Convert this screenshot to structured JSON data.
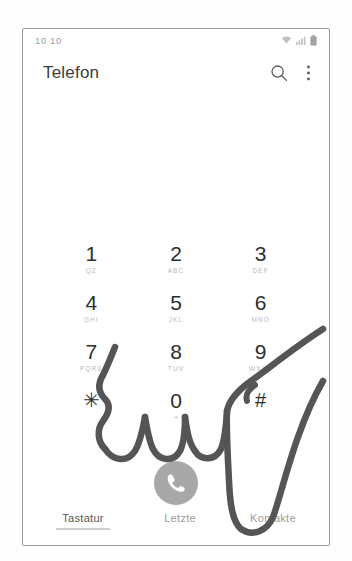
{
  "status_bar": {
    "clock": "10 10",
    "icons": [
      "wifi-icon",
      "signal-icon",
      "battery-icon"
    ]
  },
  "app_bar": {
    "title": "Telefon",
    "actions": [
      {
        "name": "search-icon",
        "label": "Suche"
      },
      {
        "name": "overflow-menu-icon",
        "label": "Mehr"
      }
    ]
  },
  "number_display": {
    "entered_number": ""
  },
  "keypad": {
    "keys": [
      {
        "digit": "1",
        "sub": "QZ"
      },
      {
        "digit": "2",
        "sub": "ABC"
      },
      {
        "digit": "3",
        "sub": "DEF"
      },
      {
        "digit": "4",
        "sub": "GHI"
      },
      {
        "digit": "5",
        "sub": "JKL"
      },
      {
        "digit": "6",
        "sub": "MNO"
      },
      {
        "digit": "7",
        "sub": "PQRS"
      },
      {
        "digit": "8",
        "sub": "TUV"
      },
      {
        "digit": "9",
        "sub": "WXYZ"
      },
      {
        "digit": "✳",
        "sub": ""
      },
      {
        "digit": "0",
        "sub": "+"
      },
      {
        "digit": "#",
        "sub": ""
      }
    ]
  },
  "call_button": {
    "name": "call-button",
    "icon": "phone-handset-icon",
    "color": "#a8a8a8"
  },
  "bottom_tabs": {
    "items": [
      {
        "label": "Tastatur",
        "active": true
      },
      {
        "label": "Letzte",
        "active": false
      },
      {
        "label": "Kontakte",
        "active": false
      }
    ]
  },
  "annotation": {
    "name": "handwritten-stroke",
    "color": "#555555",
    "description": "hand-drawn dark pen stroke over lower keypad"
  },
  "colors": {
    "frame_border": "#9a9a9a",
    "text_primary": "#2e2e2e",
    "text_secondary": "#9b9b9b",
    "sub_label": "#b9b9b9",
    "call_gray": "#a8a8a8"
  }
}
